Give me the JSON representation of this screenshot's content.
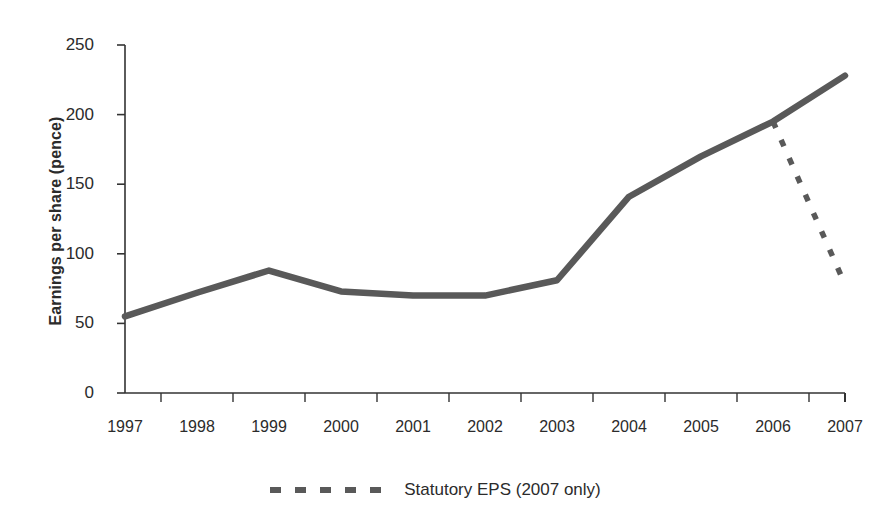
{
  "chart_data": {
    "type": "line",
    "title": "",
    "subtitle": "",
    "xlabel": "",
    "ylabel": "Earnings per share (pence)",
    "categories": [
      "1997",
      "1998",
      "1999",
      "2000",
      "2001",
      "2002",
      "2003",
      "2004",
      "2005",
      "2006",
      "2007"
    ],
    "ylim": [
      0,
      250
    ],
    "yticks": [
      0,
      50,
      100,
      150,
      200,
      250
    ],
    "ytick_labels": [
      "0",
      "50",
      "100",
      "150",
      "200",
      "250"
    ],
    "grid": false,
    "legend_position": "bottom-center",
    "series": [
      {
        "name": "Adjusted EPS",
        "style": "solid",
        "color": "#595959",
        "in_legend": false,
        "x": [
          "1997",
          "1998",
          "1999",
          "2000",
          "2001",
          "2002",
          "2003",
          "2004",
          "2005",
          "2006",
          "2007"
        ],
        "values": [
          55,
          72,
          88,
          73,
          70,
          70,
          81,
          141,
          170,
          195,
          228
        ]
      },
      {
        "name": "Statutory EPS (2007 only)",
        "style": "dashed",
        "color": "#595959",
        "in_legend": true,
        "x": [
          "2006",
          "2007"
        ],
        "values": [
          195,
          78
        ]
      }
    ]
  },
  "axes": {
    "y_title": "Earnings per share (pence)"
  },
  "legend": {
    "entries": [
      {
        "label": "Statutory EPS (2007 only)",
        "style": "dashed",
        "color": "#595959"
      }
    ]
  },
  "colors": {
    "line": "#595959",
    "axis": "#333333",
    "text": "#2b2b2b",
    "background": "#ffffff"
  }
}
